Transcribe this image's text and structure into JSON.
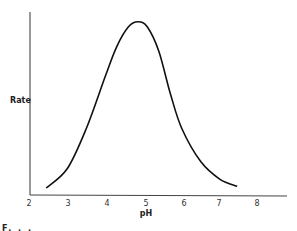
{
  "chart_data": {
    "type": "line",
    "title": "",
    "xlabel": "pH",
    "ylabel": "Rate",
    "xlim": [
      2,
      8.7
    ],
    "ylim": [
      0,
      1
    ],
    "x_ticks": [
      "2",
      "3",
      "4",
      "5",
      "6",
      "7",
      "8"
    ],
    "y_ticks": [],
    "grid": false,
    "legend": null,
    "series": [
      {
        "name": "Rate vs pH (bell-shaped curve)",
        "x": [
          2.45,
          3.0,
          3.5,
          4.0,
          4.3,
          4.6,
          4.85,
          5.1,
          5.4,
          5.7,
          6.0,
          6.5,
          7.0,
          7.45
        ],
        "y": [
          0.04,
          0.15,
          0.38,
          0.68,
          0.85,
          0.96,
          0.99,
          0.96,
          0.82,
          0.58,
          0.38,
          0.19,
          0.09,
          0.05
        ]
      }
    ],
    "annotations": [
      "F..."
    ]
  },
  "labels": {
    "ylabel": "Rate",
    "xlabel": "pH",
    "caption": "F. . ."
  },
  "ticks": [
    "2",
    "3",
    "4",
    "5",
    "6",
    "7",
    "8"
  ]
}
